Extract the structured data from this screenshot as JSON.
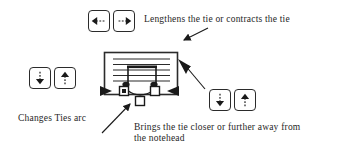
{
  "diagram": {
    "colors": {
      "ink": "#2b2b2b",
      "text": "#262626",
      "background": "#ffffff",
      "handle_fill": "#ffffff",
      "handle_selected_fill": "#1a1a1a"
    }
  },
  "captions": {
    "lengthens": "Lengthens the tie or contracts the tie",
    "changes_arc": "Changes Ties arc",
    "closer": "Brings the tie closer or further away from\nthe notehead"
  },
  "buttons": {
    "top_pair": [
      {
        "name": "arrow-left-dashed-button",
        "icon": "arrow-left-dashed-icon",
        "label": ""
      },
      {
        "name": "arrow-right-dashed-button",
        "icon": "arrow-right-dashed-icon",
        "label": ""
      }
    ],
    "left_pair": [
      {
        "name": "arrow-down-dashed-button",
        "icon": "arrow-down-dashed-icon",
        "label": ""
      },
      {
        "name": "arrow-up-dashed-button",
        "icon": "arrow-up-dashed-icon",
        "label": ""
      }
    ],
    "right_pair": [
      {
        "name": "arrow-down-dashed-button",
        "icon": "arrow-down-dashed-icon",
        "label": ""
      },
      {
        "name": "arrow-up-dashed-button",
        "icon": "arrow-up-dashed-icon",
        "label": ""
      }
    ]
  },
  "score": {
    "staff_line_count": 5,
    "notes": [
      {
        "name": "notehead-left",
        "selected": true
      },
      {
        "name": "notehead-right",
        "selected": false
      }
    ],
    "beam": true,
    "tie": true,
    "handles": [
      {
        "name": "tie-handle-left",
        "state": "selected"
      },
      {
        "name": "tie-handle-right",
        "state": "unselected"
      },
      {
        "name": "tie-handle-middle",
        "state": "unselected"
      }
    ],
    "pointers": [
      {
        "name": "pointer-left-triangle",
        "direction": "right"
      },
      {
        "name": "pointer-right-triangle",
        "direction": "left"
      },
      {
        "name": "pointer-edge-triangle",
        "direction": "up-left"
      }
    ]
  }
}
